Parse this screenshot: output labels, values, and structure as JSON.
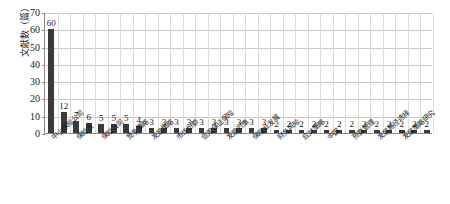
{
  "chart_data": {
    "type": "bar",
    "title": "",
    "subtitle": "",
    "xlabel": "",
    "ylabel": "文献数（篇）",
    "ylim": [
      0,
      70
    ],
    "ytick_step": 10,
    "yticks": [
      "0",
      "10",
      "20",
      "30",
      "40",
      "50",
      "60",
      "70"
    ],
    "grid": true,
    "legend": false,
    "bar_color": "#3a3a3a",
    "gridline_color": "#c8c8c8",
    "axis_color": "#8a8a8a",
    "categories": [
      "中小保险公司",
      "保险业",
      "保险公司",
      "竞争策略",
      "发展策略",
      "市场份额",
      "信用保证保险",
      "发展对策",
      "保险业发展",
      "财务风险",
      "应对策略",
      "中国",
      "预算管理",
      "发展路径选择",
      "发展策略研究",
      "核心竞争力",
      "风险管理",
      "经营模式",
      "互联网保险",
      "偿付能力",
      "差异化经营",
      "市场定位",
      "保险市场",
      "营销策略",
      "公司治理",
      "保险监管",
      "创新发展",
      "转型升级",
      "产品创新",
      "渠道建设",
      "服务质量"
    ],
    "values": [
      60,
      12,
      7,
      6,
      5,
      5,
      5,
      4,
      3,
      3,
      3,
      3,
      3,
      3,
      3,
      3,
      3,
      3,
      2,
      2,
      2,
      2,
      2,
      2,
      2,
      2,
      2,
      2,
      2,
      2,
      2
    ],
    "visible_x_labels": [
      {
        "index": 0,
        "text": "中小保险公司"
      },
      {
        "index": 2,
        "text": "保险业"
      },
      {
        "index": 4,
        "text": "保险公司"
      },
      {
        "index": 6,
        "text": "竞争策略"
      },
      {
        "index": 8,
        "text": "发展策略"
      },
      {
        "index": 10,
        "text": "市场份额"
      },
      {
        "index": 12,
        "text": "信用保证保险"
      },
      {
        "index": 14,
        "text": "发展对策"
      },
      {
        "index": 16,
        "text": "保险业发展"
      },
      {
        "index": 18,
        "text": "财务风险"
      },
      {
        "index": 20,
        "text": "应对策略"
      },
      {
        "index": 22,
        "text": "中国"
      },
      {
        "index": 24,
        "text": "预算管理"
      },
      {
        "index": 26,
        "text": "发展路径选择"
      },
      {
        "index": 28,
        "text": "发展策略研究"
      }
    ]
  }
}
